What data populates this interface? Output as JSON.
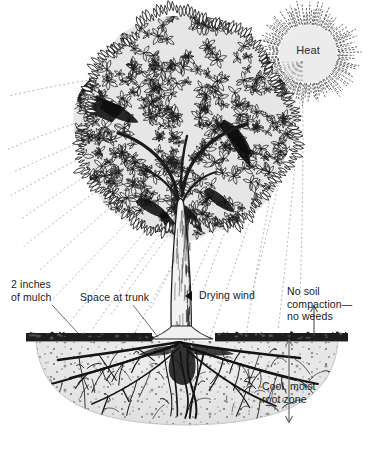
{
  "diagram": {
    "background": "#ffffff",
    "ink": "#111111"
  },
  "sun": {
    "label": "Heat",
    "fill": "#ececec",
    "ray_color": "#3a3a3a",
    "center": {
      "x": 308,
      "y": 54
    },
    "radius": 29
  },
  "labels": {
    "mulch": "2 inches\nof mulch",
    "space_at_trunk": "Space at trunk",
    "drying_wind": "Drying wind",
    "no_soil": "No soil\ncompaction—\nno weeds",
    "root_zone": "Cool, moist\nroot zone"
  },
  "icons": {
    "drying_wind_marker": "left-triangle-icon",
    "root_zone_marker": "down-arrow-icon",
    "no_soil_marker": "up-arrow-icon"
  },
  "layers": {
    "mulch_band": {
      "color": "#1d1d1d",
      "top_y": 330,
      "thickness": 11
    },
    "soil_mass": {
      "color": "#e9e9e9",
      "speckle": "#4a4a4a",
      "top_y": 341,
      "bottom_y": 426
    },
    "canopy": {
      "fill": "#e4e4e4",
      "outline": "#1b1b1b"
    },
    "trunk": {
      "fill": "#f2f2f2",
      "outline": "#1b1b1b"
    },
    "roots": {
      "color": "#151515"
    }
  }
}
